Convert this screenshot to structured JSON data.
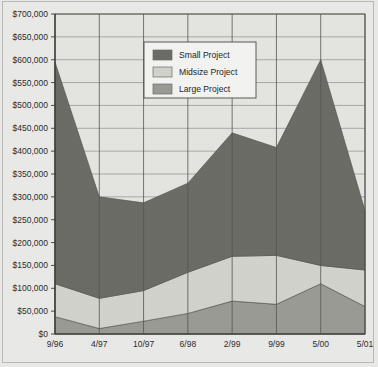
{
  "chart_data": {
    "type": "area",
    "stacked": true,
    "title": "",
    "subtitle": "",
    "xlabel": "",
    "ylabel": "",
    "categories": [
      "9/96",
      "4/97",
      "10/97",
      "6/98",
      "2/99",
      "9/99",
      "5/00",
      "5/01"
    ],
    "series": [
      {
        "name": "Large Project",
        "color": "#9a9a94",
        "values": [
          38000,
          12000,
          28000,
          45000,
          72000,
          65000,
          110000,
          60000
        ]
      },
      {
        "name": "Midsize Project",
        "color": "#d2d2cd",
        "values": [
          72000,
          66000,
          67000,
          90000,
          98000,
          107000,
          40000,
          80000
        ]
      },
      {
        "name": "Small Project",
        "color": "#6b6b66",
        "values": [
          485000,
          222000,
          192000,
          195000,
          270000,
          236000,
          450000,
          130000
        ]
      }
    ],
    "cumulative_totals": [
      595000,
      300000,
      287000,
      330000,
      440000,
      408000,
      600000,
      270000
    ],
    "band_tops": {
      "large": [
        38000,
        12000,
        28000,
        45000,
        72000,
        65000,
        110000,
        60000
      ],
      "midsize": [
        110000,
        78000,
        95000,
        135000,
        170000,
        172000,
        150000,
        140000
      ],
      "small": [
        595000,
        300000,
        287000,
        330000,
        440000,
        408000,
        600000,
        270000
      ]
    },
    "ylim": [
      0,
      700000
    ],
    "ytick_step": 50000,
    "ytick_labels": [
      "$700,000",
      "$650,000",
      "$600,000",
      "$550,000",
      "$500,000",
      "$450,000",
      "$400,000",
      "$350,000",
      "$300,000",
      "$250,000",
      "$200,000",
      "$150,000",
      "$100,000",
      "$50,000",
      "$0"
    ],
    "ytick_values": [
      700000,
      650000,
      600000,
      550000,
      500000,
      450000,
      400000,
      350000,
      300000,
      250000,
      200000,
      150000,
      100000,
      50000,
      0
    ],
    "grid": {
      "horizontal": true,
      "vertical": true
    },
    "legend": {
      "position": "top-center",
      "entries": [
        {
          "label": "Small Project",
          "color": "#6b6b66"
        },
        {
          "label": "Midsize Project",
          "color": "#d2d2cd"
        },
        {
          "label": "Large Project",
          "color": "#9a9a94"
        }
      ]
    }
  },
  "colors": {
    "background": "#e9e9e7",
    "plot_background": "#e4e4e1",
    "axis": "#3a3a36",
    "gridline_horizontal": "#8c8c88",
    "gridline_vertical": "#55554f",
    "small_project": "#6b6b66",
    "midsize_project": "#d2d2cd",
    "large_project": "#9a9a94",
    "legend_background": "#f3f3f1",
    "legend_border": "#4a4a46",
    "text": "#2b2b2b"
  }
}
